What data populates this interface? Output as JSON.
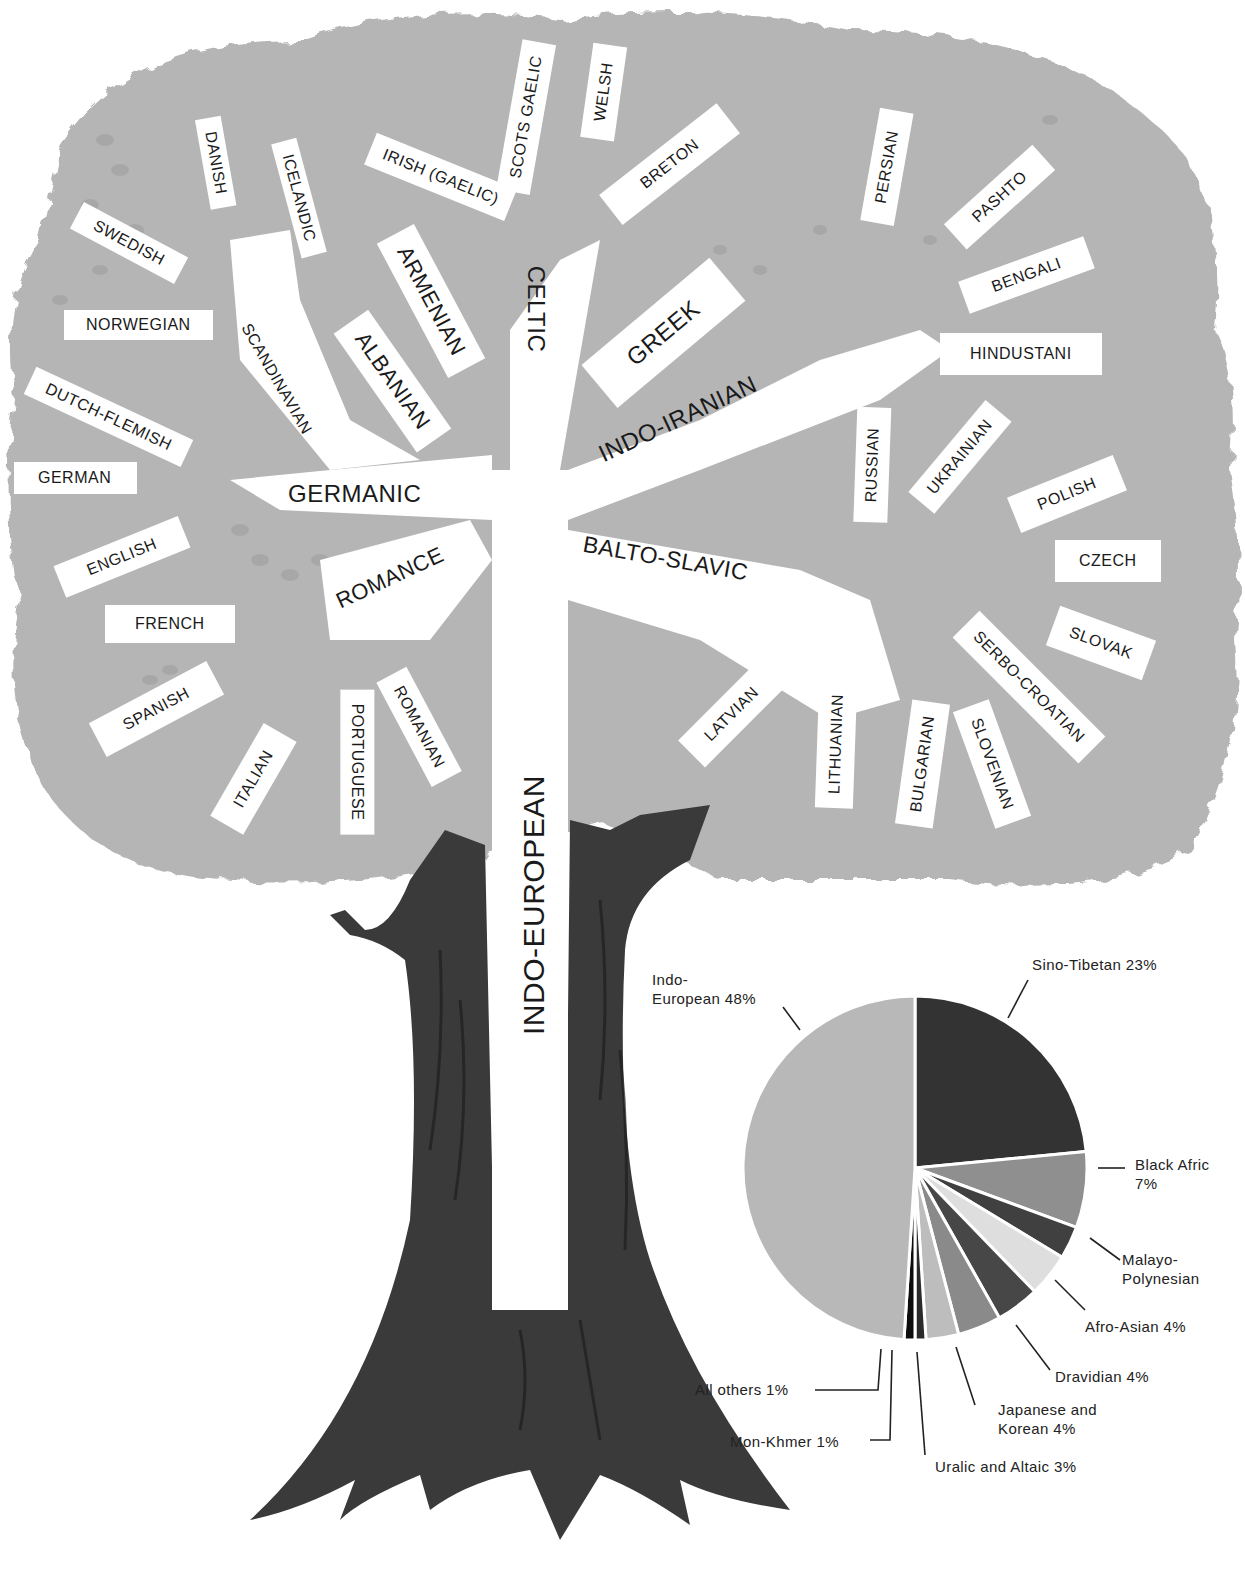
{
  "tree": {
    "trunk_label": "INDO-EUROPEAN",
    "branches": {
      "germanic": {
        "label": "GERMANIC",
        "scandinavian": {
          "label": "SCANDINAVIAN",
          "languages": [
            "DANISH",
            "ICELANDIC",
            "SWEDISH",
            "NORWEGIAN"
          ]
        },
        "languages": [
          "DUTCH-FLEMISH",
          "GERMAN",
          "ENGLISH"
        ]
      },
      "albanian": {
        "label": "ALBANIAN"
      },
      "armenian": {
        "label": "ARMENIAN"
      },
      "celtic": {
        "label": "CELTIC",
        "languages": [
          "IRISH (GAELIC)",
          "SCOTS GAELIC",
          "WELSH",
          "BRETON"
        ]
      },
      "greek": {
        "label": "GREEK"
      },
      "indo_iranian": {
        "label": "INDO-IRANIAN",
        "languages": [
          "PERSIAN",
          "PASHTO",
          "BENGALI",
          "HINDUSTANI"
        ]
      },
      "romance": {
        "label": "ROMANCE",
        "languages": [
          "FRENCH",
          "SPANISH",
          "ITALIAN",
          "PORTUGUESE",
          "ROMANIAN"
        ]
      },
      "balto_slavic": {
        "label": "BALTO-SLAVIC",
        "languages": [
          "RUSSIAN",
          "UKRAINIAN",
          "POLISH",
          "CZECH",
          "SLOVAK",
          "SERBO-CROATIAN",
          "SLOVENIAN",
          "BULGARIAN",
          "LITHUANIAN",
          "LATVIAN"
        ]
      }
    }
  },
  "pie": {
    "labels": {
      "indo_european": [
        "Indo-",
        "European 48%"
      ],
      "sino_tibetan": "Sino-Tibetan 23%",
      "black_african": [
        "Black Afric",
        "7%"
      ],
      "malayo_polynesian": [
        "Malayo-",
        "Polynesian"
      ],
      "afro_asian": "Afro-Asian 4%",
      "dravidian": "Dravidian 4%",
      "japanese_korean": [
        "Japanese and",
        "Korean 4%"
      ],
      "uralic_altaic": "Uralic and Altaic 3%",
      "mon_khmer": "Mon-Khmer 1%",
      "all_others": "All others 1%"
    }
  },
  "colors": {
    "foliage": "#b3b3b3",
    "foliage_dark": "#a2a2a2",
    "trunk": "#3a3a3a",
    "label_bg": "#ffffff",
    "text": "#1a1a1a"
  },
  "chart_data": {
    "type": "pie",
    "title": "",
    "categories": [
      "Sino-Tibetan",
      "Black African",
      "Malayo-Polynesian",
      "Afro-Asian",
      "Dravidian",
      "Japanese and Korean",
      "Uralic and Altaic",
      "Mon-Khmer",
      "All others",
      "Indo-European"
    ],
    "values": [
      23,
      7,
      3,
      4,
      4,
      4,
      3,
      1,
      1,
      48
    ],
    "unit": "%",
    "slice_colors": [
      "#333333",
      "#8f8f8f",
      "#404040",
      "#dedede",
      "#474747",
      "#8a8a8a",
      "#bdbdbd",
      "#2a2a2a",
      "#0d0d0d",
      "#b8b8b8"
    ],
    "start_angle_deg": 0,
    "direction": "clockwise",
    "legend_position": "callout labels around pie"
  }
}
